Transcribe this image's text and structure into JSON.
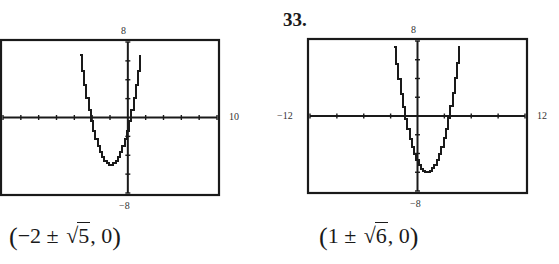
{
  "graphs": [
    {
      "problem_number": "",
      "labels": {
        "ymax": "8",
        "ymin": "−8",
        "xmax": "10",
        "xmin": ""
      },
      "answer": {
        "open": "(",
        "prefix": "−2 ± ",
        "radicand": "5",
        "suffix": ", 0",
        "close": ")"
      }
    },
    {
      "problem_number": "33.",
      "labels": {
        "ymax": "8",
        "ymin": "−8",
        "xmax": "12",
        "xmin": "−12"
      },
      "answer": {
        "open": "(",
        "prefix": "1 ± ",
        "radicand": "6",
        "suffix": ", 0",
        "close": ")"
      }
    }
  ],
  "chart_data": [
    {
      "type": "line",
      "title": "",
      "description": "Graphing-calculator window showing an upward parabola y = x^2 + 4x - 1",
      "function": "y = x^2 + 4x - 1",
      "xlim": [
        -14,
        10
      ],
      "ylim": [
        -8,
        8
      ],
      "x_tick_step": 2,
      "y_tick_step": 2,
      "grid": false,
      "window_labels": {
        "ymax": "8",
        "ymin": "-8",
        "xmax": "10"
      },
      "x_intercepts": [
        "-2 - sqrt(5)",
        "-2 + sqrt(5)"
      ],
      "x_intercepts_approx": [
        -4.24,
        0.24
      ],
      "vertex": [
        -2,
        -5
      ],
      "answer_label": "(-2 ± √5, 0)"
    },
    {
      "type": "line",
      "title": "33.",
      "description": "Graphing-calculator window showing an upward parabola y = x^2 - 2x - 5",
      "function": "y = x^2 - 2x - 5",
      "xlim": [
        -12,
        12
      ],
      "ylim": [
        -8,
        8
      ],
      "x_tick_step": 3,
      "y_tick_step": 2,
      "grid": false,
      "window_labels": {
        "ymax": "8",
        "ymin": "-8",
        "xmin": "-12",
        "xmax": "12"
      },
      "x_intercepts": [
        "1 - sqrt(6)",
        "1 + sqrt(6)"
      ],
      "x_intercepts_approx": [
        -1.45,
        3.45
      ],
      "vertex": [
        1,
        -6
      ],
      "answer_label": "(1 ± √6, 0)"
    }
  ]
}
